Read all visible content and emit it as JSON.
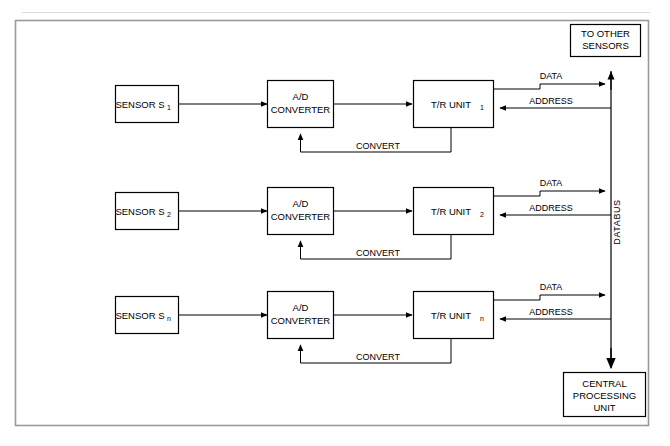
{
  "page": {
    "header_left": "",
    "header_right": "",
    "background_color": "#ffffff",
    "line_color": "#000000",
    "border_color": "#9a9a9a"
  },
  "diagram": {
    "rows": [
      {
        "sensor_label": "SENSOR S",
        "sensor_subscript": "1",
        "adc_line1": "A/D",
        "adc_line2": "CONVERTER",
        "tr_label": "T/R UNIT",
        "tr_subscript": "1",
        "data_label": "DATA",
        "address_label": "ADDRESS",
        "convert_label": "CONVERT"
      },
      {
        "sensor_label": "SENSOR S",
        "sensor_subscript": "2",
        "adc_line1": "A/D",
        "adc_line2": "CONVERTER",
        "tr_label": "T/R UNIT",
        "tr_subscript": "2",
        "data_label": "DATA",
        "address_label": "ADDRESS",
        "convert_label": "CONVERT"
      },
      {
        "sensor_label": "SENSOR S",
        "sensor_subscript": "n",
        "adc_line1": "A/D",
        "adc_line2": "CONVERTER",
        "tr_label": "T/R UNIT",
        "tr_subscript": "n",
        "data_label": "DATA",
        "address_label": "ADDRESS",
        "convert_label": "CONVERT"
      }
    ],
    "top_box": {
      "line1": "TO OTHER",
      "line2": "SENSORS"
    },
    "bottom_box": {
      "line1": "CENTRAL",
      "line2": "PROCESSING",
      "line3": "UNIT"
    },
    "bus_label": "DATABUS"
  }
}
